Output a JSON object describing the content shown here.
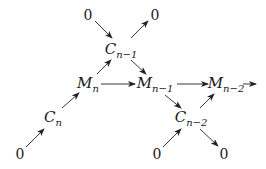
{
  "diagram": {
    "title": "",
    "nodes": [
      {
        "id": "zero_tl",
        "label": "0",
        "x": 88,
        "y": 15
      },
      {
        "id": "zero_tr",
        "label": "0",
        "x": 155,
        "y": 15
      },
      {
        "id": "C_n_minus_1",
        "label": "C",
        "sub": "n−1",
        "x": 120,
        "y": 50
      },
      {
        "id": "M_n",
        "label": "M",
        "sub": "n",
        "x": 88,
        "y": 84
      },
      {
        "id": "M_n_minus_1",
        "label": "M",
        "sub": "n−1",
        "x": 152,
        "y": 84
      },
      {
        "id": "M_n_minus_2",
        "label": "M",
        "sub": "n−2",
        "x": 224,
        "y": 84
      },
      {
        "id": "C_n",
        "label": "C",
        "sub": "n",
        "x": 52,
        "y": 117
      },
      {
        "id": "C_n_minus_2",
        "label": "C",
        "sub": "n−2",
        "x": 190,
        "y": 117
      },
      {
        "id": "zero_bl",
        "label": "0",
        "x": 20,
        "y": 154
      },
      {
        "id": "zero_bm",
        "label": "0",
        "x": 157,
        "y": 154
      },
      {
        "id": "zero_br",
        "label": "0",
        "x": 224,
        "y": 154
      }
    ],
    "edges": [
      {
        "from": "zero_tl",
        "to": "C_n_minus_1"
      },
      {
        "from": "C_n_minus_1",
        "to": "zero_tr"
      },
      {
        "from": "M_n",
        "to": "C_n_minus_1"
      },
      {
        "from": "C_n_minus_1",
        "to": "M_n_minus_1"
      },
      {
        "from": "M_n",
        "to": "M_n_minus_1"
      },
      {
        "from": "M_n_minus_1",
        "to": "M_n_minus_2"
      },
      {
        "from": "M_n_minus_2",
        "to": "offscreen_right"
      },
      {
        "from": "C_n",
        "to": "M_n"
      },
      {
        "from": "zero_bl",
        "to": "C_n"
      },
      {
        "from": "M_n_minus_1",
        "to": "C_n_minus_2"
      },
      {
        "from": "C_n_minus_2",
        "to": "M_n_minus_2"
      },
      {
        "from": "zero_bm",
        "to": "C_n_minus_2"
      },
      {
        "from": "C_n_minus_2",
        "to": "zero_br"
      }
    ]
  }
}
